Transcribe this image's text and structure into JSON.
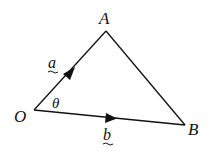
{
  "diagram": {
    "type": "vector-triangle",
    "vertices": {
      "O": {
        "label": "O",
        "x": 34,
        "y": 110
      },
      "A": {
        "label": "A",
        "x": 106,
        "y": 31
      },
      "B": {
        "label": "B",
        "x": 185,
        "y": 125
      }
    },
    "edges": [
      {
        "from": "O",
        "to": "A",
        "vector_label": "a",
        "arrow": true
      },
      {
        "from": "O",
        "to": "B",
        "vector_label": "b",
        "arrow": true
      },
      {
        "from": "A",
        "to": "B",
        "vector_label": "",
        "arrow": false
      }
    ],
    "angle_label": "θ",
    "labels": {
      "A": "A",
      "O": "O",
      "B": "B",
      "a": "a",
      "b": "b",
      "theta": "θ"
    },
    "colors": {
      "stroke": "#111111",
      "background": "#ffffff"
    }
  }
}
